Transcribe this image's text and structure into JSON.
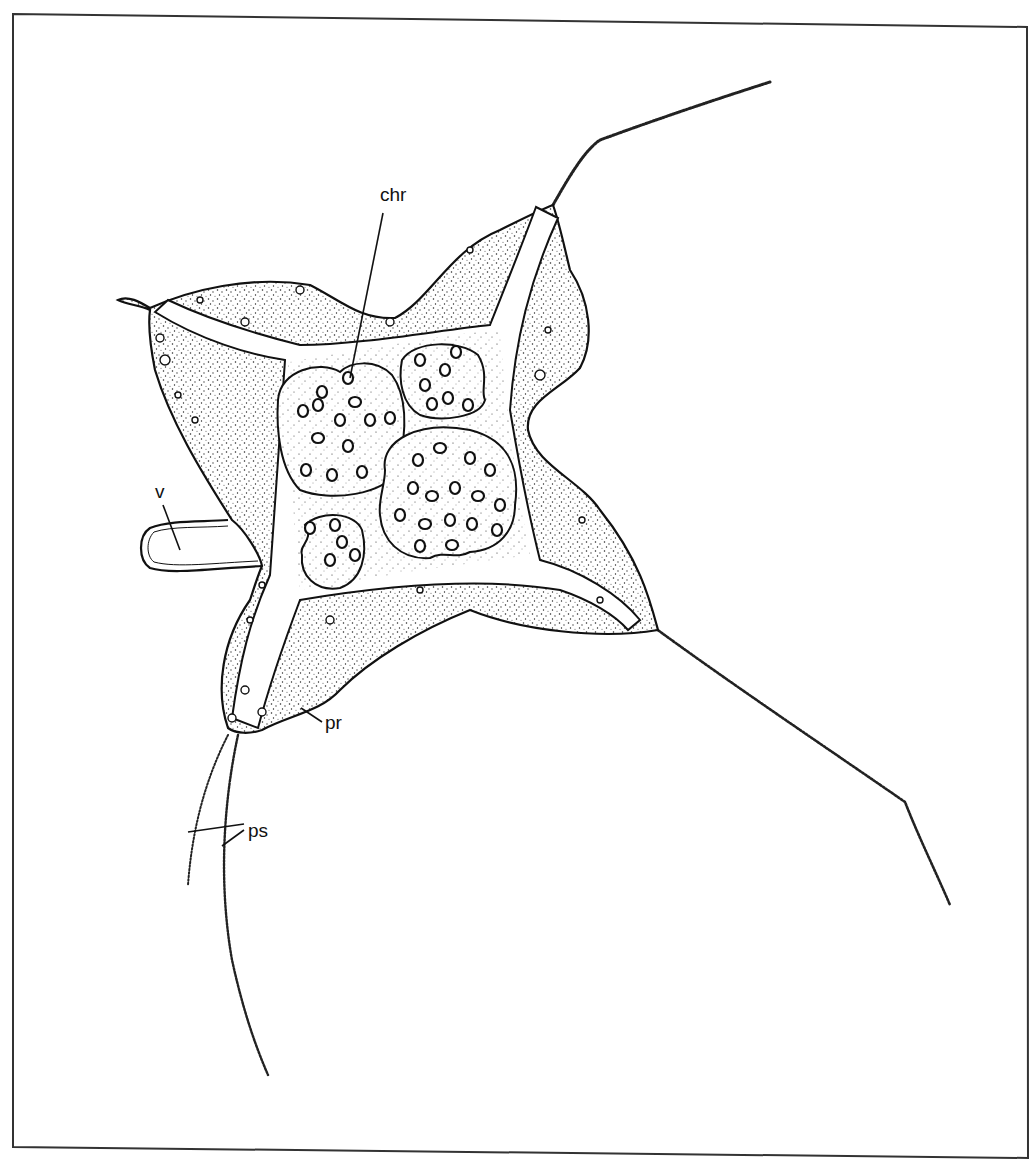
{
  "figure": {
    "type": "stippled biological line drawing",
    "colors": {
      "ink": "#111111",
      "paper": "#ffffff",
      "frame": "#333333"
    }
  },
  "labels": [
    {
      "id": "chr",
      "text": "chr",
      "x": 393,
      "y": 200,
      "leader": [
        [
          383,
          213
        ],
        [
          350,
          378
        ]
      ]
    },
    {
      "id": "v",
      "text": "v",
      "x": 158,
      "y": 497,
      "leader": [
        [
          163,
          505
        ],
        [
          180,
          550
        ]
      ]
    },
    {
      "id": "pr",
      "text": "pr",
      "x": 326,
      "y": 728,
      "leader": [
        [
          301,
          708
        ],
        [
          322,
          722
        ]
      ]
    },
    {
      "id": "ps",
      "text": "ps",
      "x": 248,
      "y": 837,
      "leaders": [
        [
          [
            188,
            832
          ],
          [
            244,
            824
          ]
        ],
        [
          [
            222,
            846
          ],
          [
            244,
            830
          ]
        ]
      ]
    }
  ],
  "structures": {
    "nuclei": [
      {
        "name": "nucleus-top-left",
        "cx": 340,
        "cy": 428,
        "rx": 62,
        "ry": 65
      },
      {
        "name": "nucleus-top-right",
        "cx": 442,
        "cy": 380,
        "rx": 42,
        "ry": 38
      },
      {
        "name": "nucleus-bottom-left",
        "cx": 336,
        "cy": 550,
        "rx": 32,
        "ry": 36
      },
      {
        "name": "nucleus-large",
        "cx": 450,
        "cy": 495,
        "rx": 68,
        "ry": 62
      }
    ],
    "pseudopodia": [
      {
        "name": "upper-right",
        "points": [
          [
            555,
            200
          ],
          [
            600,
            140
          ],
          [
            770,
            82
          ]
        ]
      },
      {
        "name": "lower-right",
        "points": [
          [
            660,
            630
          ],
          [
            905,
            802
          ],
          [
            950,
            905
          ]
        ]
      },
      {
        "name": "lower-left-outer",
        "points": [
          [
            228,
            735
          ],
          [
            196,
            800
          ],
          [
            188,
            885
          ]
        ]
      },
      {
        "name": "lower-left-inner",
        "points": [
          [
            238,
            735
          ],
          [
            222,
            846
          ],
          [
            232,
            960
          ],
          [
            268,
            1075
          ]
        ]
      }
    ]
  }
}
